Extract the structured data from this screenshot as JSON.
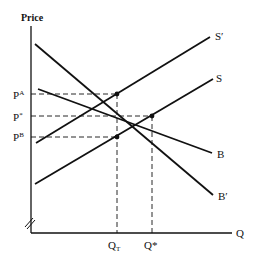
{
  "diagram": {
    "type": "supply-demand",
    "axes": {
      "y_label": "Price",
      "x_label": "Q",
      "axis_break": true
    },
    "curves": [
      {
        "name": "S'",
        "label": "S′",
        "kind": "supply",
        "from": [
          36,
          143
        ],
        "to": [
          210,
          37
        ]
      },
      {
        "name": "S",
        "label": "S",
        "kind": "supply",
        "from": [
          35,
          184
        ],
        "to": [
          213,
          79
        ]
      },
      {
        "name": "B",
        "label": "B",
        "kind": "demand",
        "from": [
          38,
          89
        ],
        "to": [
          212,
          153
        ]
      },
      {
        "name": "B'",
        "label": "B′",
        "kind": "demand",
        "from": [
          35,
          44
        ],
        "to": [
          213,
          195
        ]
      }
    ],
    "price_levels": [
      {
        "label": "P",
        "sup": "A",
        "y": 94
      },
      {
        "label": "P",
        "sup": "*",
        "y": 116
      },
      {
        "label": "P",
        "sup": "B",
        "y": 137
      }
    ],
    "quantity_levels": [
      {
        "label": "Q",
        "sub": "T",
        "x": 117
      },
      {
        "label": "Q*",
        "sub": "",
        "x": 152
      }
    ],
    "intersections": [
      {
        "x": 117,
        "y": 94
      },
      {
        "x": 152,
        "y": 116
      },
      {
        "x": 117,
        "y": 137
      }
    ]
  }
}
